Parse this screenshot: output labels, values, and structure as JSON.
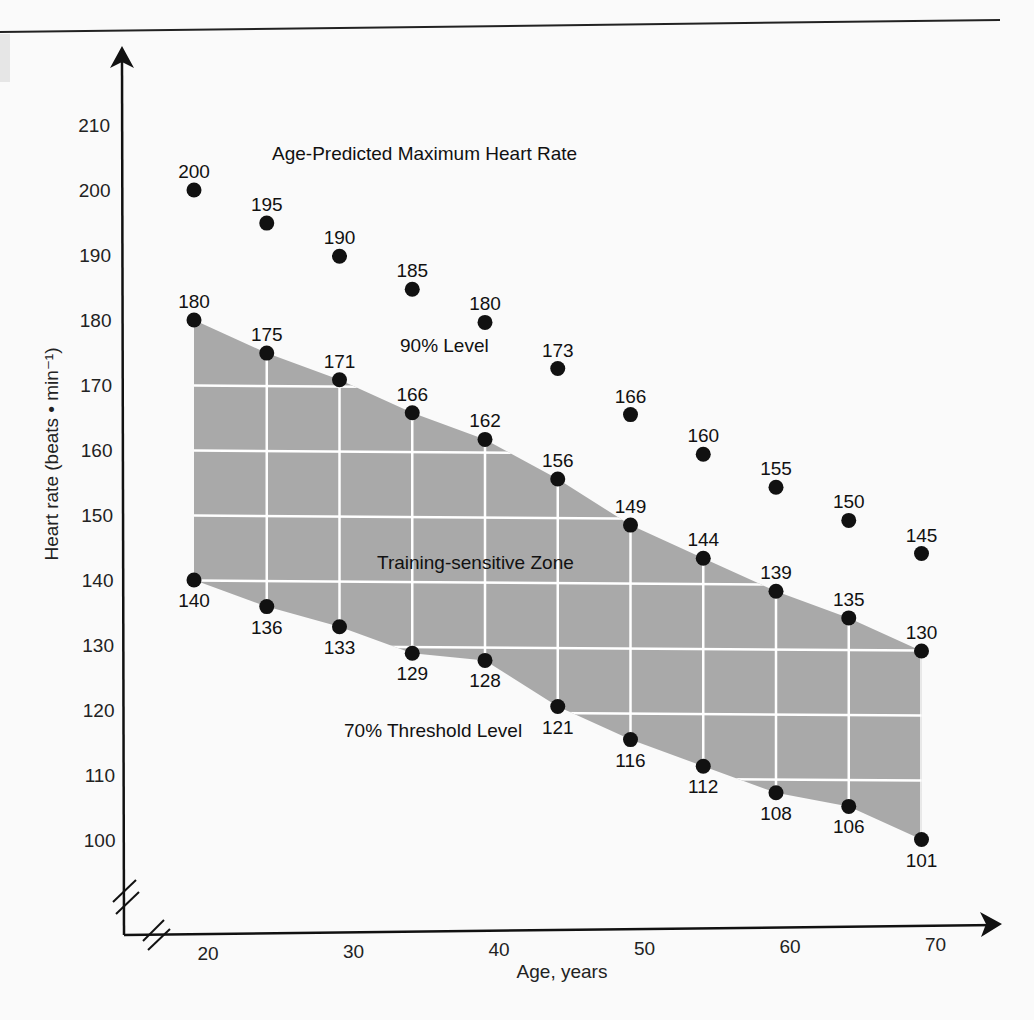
{
  "chart_data": {
    "type": "scatter",
    "title": "",
    "xlabel": "Age, years",
    "ylabel": "Heart rate (beats • min⁻¹)",
    "x_ticks": [
      20,
      30,
      40,
      50,
      60,
      70
    ],
    "y_ticks": [
      100,
      110,
      120,
      130,
      140,
      150,
      160,
      170,
      180,
      190,
      200,
      210
    ],
    "xlim": [
      15,
      74
    ],
    "ylim": [
      86,
      222
    ],
    "grid": "white grid inside shaded zone only",
    "axis_breaks": true,
    "annotations": {
      "max": "Age-Predicted Maximum Heart Rate",
      "p90": "90% Level",
      "zone": "Training-sensitive Zone",
      "p70": "70% Threshold Level"
    },
    "ages": [
      20,
      25,
      30,
      35,
      40,
      45,
      50,
      55,
      60,
      65,
      70
    ],
    "series": [
      {
        "name": "Age-Predicted Maximum Heart Rate",
        "values": [
          200,
          195,
          190,
          185,
          180,
          173,
          166,
          160,
          155,
          150,
          145
        ]
      },
      {
        "name": "90% Level",
        "values": [
          180,
          175,
          171,
          166,
          162,
          156,
          149,
          144,
          139,
          135,
          130
        ]
      },
      {
        "name": "70% Threshold Level",
        "values": [
          140,
          136,
          133,
          129,
          128,
          121,
          116,
          112,
          108,
          106,
          101
        ]
      }
    ],
    "zone": {
      "name": "Training-sensitive Zone",
      "upper": "90% Level",
      "lower": "70% Threshold Level",
      "fill": "#a9a9a9"
    }
  },
  "colors": {
    "zone_fill": "#a9a9a9",
    "grid": "#ffffff",
    "points": "#111111",
    "axis": "#111111",
    "background": "#fafafa"
  }
}
